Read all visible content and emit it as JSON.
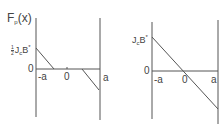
{
  "diagram": {
    "left_panel": {
      "y_label": "Fp(x)",
      "y_label_main": "F",
      "y_label_sub": "p",
      "y_label_arg": "(x)",
      "top_tick": {
        "frac_num": "1",
        "frac_den": "2",
        "j": "J",
        "j_sub": "c",
        "b": "B",
        "b_sup": "*"
      },
      "zero_y": "0",
      "x_ticks": [
        "-a",
        "0",
        "a"
      ]
    },
    "right_panel": {
      "top_tick": {
        "j": "J",
        "j_sub": "c",
        "b": "B",
        "b_sup": "*"
      },
      "zero_y": "0",
      "x_ticks": [
        "-a",
        "0",
        "a"
      ]
    },
    "colors": {
      "line": "#555555",
      "text": "#444444"
    }
  }
}
